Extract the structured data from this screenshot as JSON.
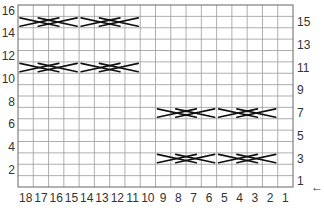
{
  "chart": {
    "title": "",
    "columns": 18,
    "rows": 16,
    "column_labels": [
      "18",
      "17",
      "16",
      "15",
      "14",
      "13",
      "12",
      "11",
      "10",
      "9",
      "8",
      "7",
      "6",
      "5",
      "4",
      "3",
      "2",
      "1"
    ],
    "row_labels_left": [
      "16",
      "14",
      "12",
      "10",
      "8",
      "6",
      "4",
      "2"
    ],
    "row_labels_right": [
      "15",
      "13",
      "11",
      "9",
      "7",
      "5",
      "3",
      "1"
    ],
    "start_arrow": "←",
    "colors": {
      "grid": "#9a9a9a",
      "frame": "#666666",
      "cable": "#111111",
      "background": "#ffffff"
    }
  },
  "chart_data": {
    "type": "table",
    "grid": {
      "columns": 18,
      "rows": 16
    },
    "x_ticks": [
      18,
      17,
      16,
      15,
      14,
      13,
      12,
      11,
      10,
      9,
      8,
      7,
      6,
      5,
      4,
      3,
      2,
      1
    ],
    "y_ticks_left": [
      16,
      14,
      12,
      10,
      8,
      6,
      4,
      2
    ],
    "y_ticks_right": [
      15,
      13,
      11,
      9,
      7,
      5,
      3,
      1
    ],
    "row_start_indicator": {
      "row": 1,
      "side": "right",
      "symbol": "←"
    },
    "cable_crosses": [
      {
        "row": 15,
        "columns": [
          18,
          17,
          16,
          15
        ]
      },
      {
        "row": 15,
        "columns": [
          14,
          13,
          12,
          11
        ]
      },
      {
        "row": 11,
        "columns": [
          18,
          17,
          16,
          15
        ]
      },
      {
        "row": 11,
        "columns": [
          14,
          13,
          12,
          11
        ]
      },
      {
        "row": 7,
        "columns": [
          9,
          8,
          7,
          6
        ]
      },
      {
        "row": 7,
        "columns": [
          5,
          4,
          3,
          2
        ]
      },
      {
        "row": 3,
        "columns": [
          9,
          8,
          7,
          6
        ]
      },
      {
        "row": 3,
        "columns": [
          5,
          4,
          3,
          2
        ]
      }
    ]
  }
}
